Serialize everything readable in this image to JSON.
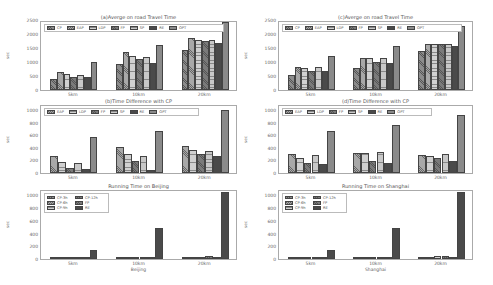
{
  "chart_data": [
    {
      "type": "bar",
      "panel": "top-left",
      "title": "(a)Averge on road Travel Time",
      "xlabel": "",
      "ylabel": "sec",
      "ylim": [
        0,
        2500
      ],
      "yticks": [
        "0",
        "500",
        "1000",
        "1500",
        "2000",
        "2500"
      ],
      "categories": [
        "5km",
        "10km",
        "20km"
      ],
      "legend_position": "upper center (inside)",
      "series": [
        {
          "name": "CP",
          "values": [
            400,
            950,
            1450
          ]
        },
        {
          "name": "EAP",
          "values": [
            660,
            1360,
            1880
          ]
        },
        {
          "name": "LDP",
          "values": [
            580,
            1250,
            1830
          ]
        },
        {
          "name": "FP",
          "values": [
            480,
            1120,
            1760
          ]
        },
        {
          "name": "SP",
          "values": [
            550,
            1210,
            1800
          ]
        },
        {
          "name": "RE",
          "values": [
            470,
            980,
            1720
          ]
        },
        {
          "name": "OPT",
          "values": [
            1000,
            1620,
            2480
          ]
        }
      ]
    },
    {
      "type": "bar",
      "panel": "top-right",
      "title": "(c)Averge on road Travel Time",
      "xlabel": "",
      "ylabel": "sec",
      "ylim": [
        0,
        2500
      ],
      "yticks": [
        "0",
        "500",
        "1000",
        "1500",
        "2000",
        "2500"
      ],
      "categories": [
        "5km",
        "10km",
        "20km"
      ],
      "legend_position": "upper center (inside)",
      "series": [
        {
          "name": "CP",
          "values": [
            540,
            810,
            1400
          ]
        },
        {
          "name": "EAP",
          "values": [
            850,
            1150,
            1680
          ]
        },
        {
          "name": "LDP",
          "values": [
            790,
            1150,
            1680
          ]
        },
        {
          "name": "FP",
          "values": [
            700,
            1000,
            1650
          ]
        },
        {
          "name": "SP",
          "values": [
            830,
            1160,
            1680
          ]
        },
        {
          "name": "RE",
          "values": [
            690,
            980,
            1580
          ]
        },
        {
          "name": "OPT",
          "values": [
            1220,
            1600,
            2330
          ]
        }
      ]
    },
    {
      "type": "bar",
      "panel": "middle-left",
      "title": "(b)Time Difference with CP",
      "xlabel": "",
      "ylabel": "sec",
      "ylim": [
        0,
        1100
      ],
      "yticks": [
        "0",
        "200",
        "400",
        "600",
        "800",
        "1000"
      ],
      "categories": [
        "5km",
        "10km",
        "20km"
      ],
      "legend_position": "upper left (inside)",
      "series": [
        {
          "name": "EAP",
          "values": [
            270,
            420,
            440
          ]
        },
        {
          "name": "LDP",
          "values": [
            180,
            300,
            380
          ]
        },
        {
          "name": "FP",
          "values": [
            80,
            190,
            300
          ]
        },
        {
          "name": "SP",
          "values": [
            160,
            270,
            350
          ]
        },
        {
          "name": "RE",
          "values": [
            70,
            50,
            270
          ]
        },
        {
          "name": "OPT",
          "values": [
            590,
            680,
            1020
          ]
        }
      ]
    },
    {
      "type": "bar",
      "panel": "middle-right",
      "title": "(d)Time Difference with CP",
      "xlabel": "",
      "ylabel": "sec",
      "ylim": [
        0,
        1100
      ],
      "yticks": [
        "0",
        "200",
        "400",
        "600",
        "800",
        "1000"
      ],
      "categories": [
        "5km",
        "10km",
        "20km"
      ],
      "legend_position": "upper left (inside)",
      "series": [
        {
          "name": "EAP",
          "values": [
            310,
            330,
            290
          ]
        },
        {
          "name": "LDP",
          "values": [
            250,
            330,
            280
          ]
        },
        {
          "name": "FP",
          "values": [
            160,
            190,
            240
          ]
        },
        {
          "name": "SP",
          "values": [
            290,
            340,
            300
          ]
        },
        {
          "name": "RE",
          "values": [
            150,
            170,
            200
          ]
        },
        {
          "name": "OPT",
          "values": [
            680,
            770,
            940
          ]
        }
      ]
    },
    {
      "type": "bar",
      "panel": "bottom-left",
      "title": "Running Time on Beijing",
      "xlabel": "Beijing",
      "ylabel": "sec",
      "ylim": [
        0,
        1100
      ],
      "yticks": [
        "0",
        "200",
        "400",
        "600",
        "800",
        "1000"
      ],
      "categories": [
        "5km",
        "10km",
        "20km"
      ],
      "legend_position": "upper left (inside), 2 columns",
      "series": [
        {
          "name": "CP-3h",
          "values": [
            8,
            15,
            18
          ]
        },
        {
          "name": "CP-6h",
          "values": [
            10,
            22,
            30
          ]
        },
        {
          "name": "CP-9h",
          "values": [
            12,
            28,
            40
          ]
        },
        {
          "name": "CP-12h",
          "values": [
            14,
            32,
            50
          ]
        },
        {
          "name": "FP",
          "values": [
            9,
            20,
            28
          ]
        },
        {
          "name": "RE",
          "values": [
            150,
            490,
            1070
          ]
        }
      ]
    },
    {
      "type": "bar",
      "panel": "bottom-right",
      "title": "Running Time on Shanghai",
      "xlabel": "Shanghai",
      "ylabel": "sec",
      "ylim": [
        0,
        1100
      ],
      "yticks": [
        "0",
        "200",
        "400",
        "600",
        "800",
        "1000"
      ],
      "categories": [
        "5km",
        "10km",
        "20km"
      ],
      "legend_position": "upper left (inside), 2 columns",
      "series": [
        {
          "name": "CP-3h",
          "values": [
            8,
            15,
            20
          ]
        },
        {
          "name": "CP-6h",
          "values": [
            10,
            22,
            32
          ]
        },
        {
          "name": "CP-9h",
          "values": [
            12,
            28,
            42
          ]
        },
        {
          "name": "CP-12h",
          "values": [
            14,
            32,
            52
          ]
        },
        {
          "name": "FP",
          "values": [
            9,
            20,
            28
          ]
        },
        {
          "name": "RE",
          "values": [
            150,
            490,
            1070
          ]
        }
      ]
    }
  ],
  "styles": {
    "CP": {
      "color": "#8c8c8c",
      "pattern": "diag"
    },
    "EAP": {
      "color": "#a8a8a8",
      "pattern": "cross"
    },
    "LDP": {
      "color": "#d0d0d0",
      "pattern": "grid"
    },
    "FP": {
      "color": "#7a7a7a",
      "pattern": "diag"
    },
    "SP": {
      "color": "#c8c8c8",
      "pattern": "grid"
    },
    "RE": {
      "color": "#4a4a4a",
      "pattern": "dots"
    },
    "OPT": {
      "color": "#8a8a8a",
      "pattern": "dots"
    },
    "CP-3h": {
      "color": "#8c8c8c",
      "pattern": "diag"
    },
    "CP-6h": {
      "color": "#a8a8a8",
      "pattern": "cross"
    },
    "CP-9h": {
      "color": "#d0d0d0",
      "pattern": "grid"
    },
    "CP-12h": {
      "color": "#7a7a7a",
      "pattern": "diag"
    }
  }
}
